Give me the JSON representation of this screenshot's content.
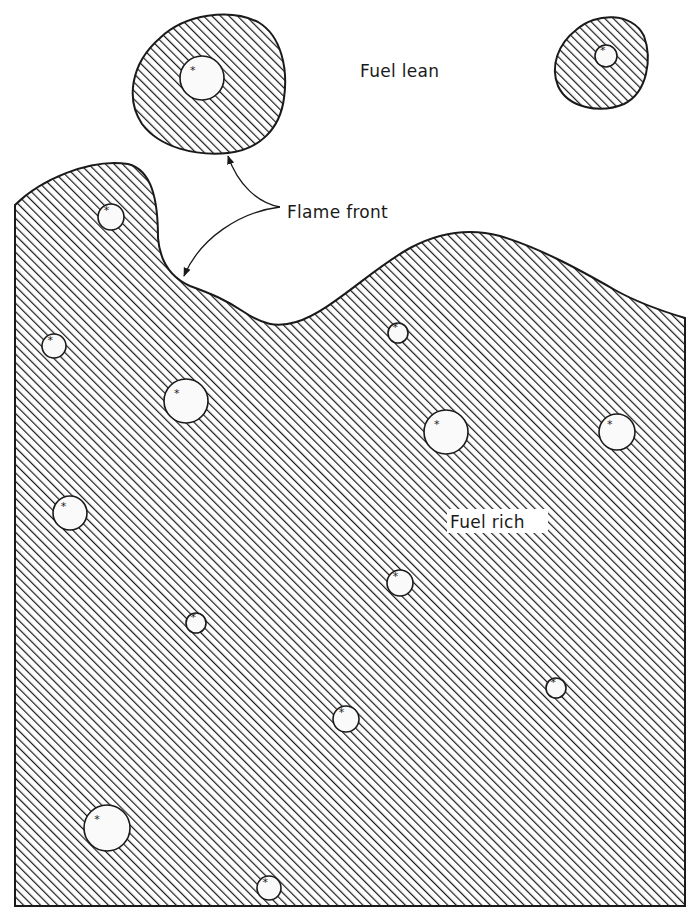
{
  "figure": {
    "width": 697,
    "height": 922,
    "background": "#ffffff",
    "ink_color": "#1a1a1a",
    "hatch": {
      "angle_deg": 45,
      "spacing_px": 6,
      "stroke_px": 2.2
    }
  },
  "labels": {
    "fuel_lean": "Fuel lean",
    "flame_front": "Flame front",
    "fuel_rich": "Fuel rich"
  },
  "regions": {
    "fuel_rich_zone": "hatched combustion zone bounded by flame front",
    "droplet_cloud_large": "isolated droplet with envelope flame",
    "droplet_cloud_small": "isolated droplet with envelope flame"
  },
  "droplets": [
    {
      "cx": 202,
      "cy": 78,
      "r": 22,
      "zone": "cloud-large"
    },
    {
      "cx": 606,
      "cy": 56,
      "r": 11,
      "zone": "cloud-small"
    },
    {
      "cx": 111,
      "cy": 217,
      "r": 13,
      "zone": "rich"
    },
    {
      "cx": 54,
      "cy": 346,
      "r": 12,
      "zone": "rich"
    },
    {
      "cx": 398,
      "cy": 333,
      "r": 10,
      "zone": "rich"
    },
    {
      "cx": 186,
      "cy": 401,
      "r": 22,
      "zone": "rich"
    },
    {
      "cx": 446,
      "cy": 432,
      "r": 22,
      "zone": "rich"
    },
    {
      "cx": 617,
      "cy": 432,
      "r": 18,
      "zone": "rich"
    },
    {
      "cx": 70,
      "cy": 513,
      "r": 17,
      "zone": "rich"
    },
    {
      "cx": 400,
      "cy": 583,
      "r": 13,
      "zone": "rich"
    },
    {
      "cx": 196,
      "cy": 623,
      "r": 10,
      "zone": "rich"
    },
    {
      "cx": 556,
      "cy": 688,
      "r": 10,
      "zone": "rich"
    },
    {
      "cx": 346,
      "cy": 719,
      "r": 13,
      "zone": "rich"
    },
    {
      "cx": 107,
      "cy": 828,
      "r": 23,
      "zone": "rich"
    },
    {
      "cx": 269,
      "cy": 888,
      "r": 12,
      "zone": "rich"
    }
  ],
  "droplet_marker": "*"
}
